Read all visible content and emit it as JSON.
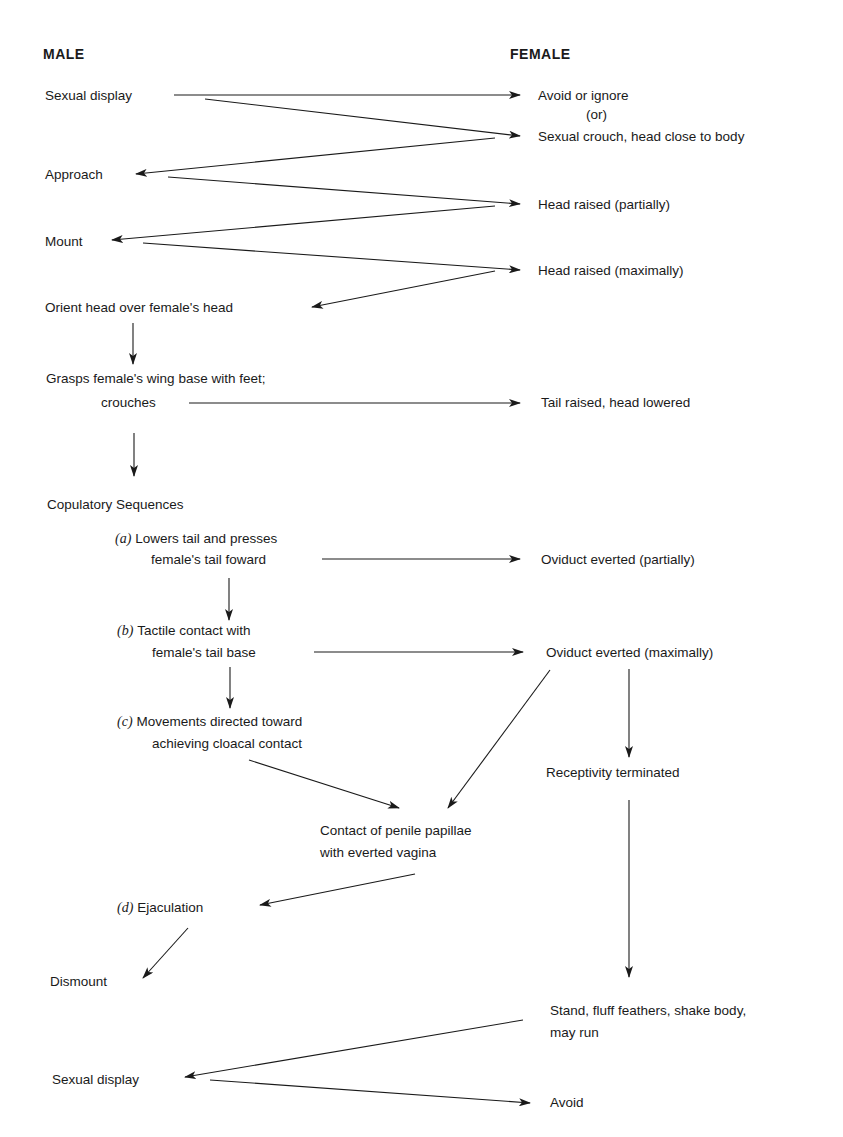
{
  "headers": {
    "male": "MALE",
    "female": "FEMALE"
  },
  "male": {
    "sexual_display": "Sexual display",
    "approach": "Approach",
    "mount": "Mount",
    "orient": "Orient head over female's head",
    "grasps_l1": "Grasps female's wing base with feet;",
    "grasps_l2": "crouches",
    "copulatory": "Copulatory Sequences",
    "a_tag": "(a)",
    "a_l1": "Lowers tail and presses",
    "a_l2": "female's tail foward",
    "b_tag": "(b)",
    "b_l1": "Tactile contact with",
    "b_l2": "female's tail base",
    "c_tag": "(c)",
    "c_l1": "Movements directed toward",
    "c_l2": "achieving cloacal contact",
    "contact_l1": "Contact of penile papillae",
    "contact_l2": "with everted vagina",
    "d_tag": "(d)",
    "d_label": "Ejaculation",
    "dismount": "Dismount",
    "sexual_display_2": "Sexual display"
  },
  "female": {
    "avoid_ignore": "Avoid or ignore",
    "or": "(or)",
    "crouch": "Sexual crouch, head close to body",
    "head_partial": "Head raised (partially)",
    "head_max": "Head raised (maximally)",
    "tail_raised": "Tail raised, head lowered",
    "oviduct_partial": "Oviduct everted (partially)",
    "oviduct_max": "Oviduct everted (maximally)",
    "receptivity": "Receptivity terminated",
    "stand_l1": "Stand, fluff feathers, shake body,",
    "stand_l2": "may run",
    "avoid": "Avoid"
  },
  "colors": {
    "ink": "#1a1a1a",
    "background": "#ffffff"
  }
}
